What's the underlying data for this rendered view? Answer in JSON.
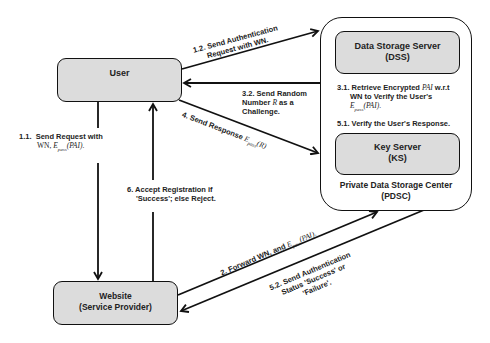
{
  "nodes": {
    "user": {
      "label": "User"
    },
    "website": {
      "line1": "Website",
      "line2": "(Service Provider)"
    },
    "pdsc": {
      "line1": "Private Data Storage Center",
      "line2": "(PDSC)"
    },
    "dss": {
      "line1": "Data Storage Server",
      "line2": "(DSS)"
    },
    "ks": {
      "line1": "Key Server",
      "line2": "(KS)"
    }
  },
  "steps": {
    "s1_1": {
      "num": "1.1.",
      "line1": "Send Request with",
      "line2_prefix": "WN, ",
      "line2_math": "E",
      "line2_sub": "pass",
      "line2_args": "(PAI)",
      "line2_suffix": "."
    },
    "s1_2": {
      "line1": "1.2. Send Authentication",
      "line2": "Request with WN."
    },
    "s2": {
      "text": "2. Forward WN, and ",
      "math": "E",
      "sub": "pass",
      "args": "(PAI)",
      "suffix": "."
    },
    "s3_1": {
      "line1_prefix": "3.1. Retrieve Encrypted ",
      "line1_math": "PAI",
      "line1_suffix": " w.r.t",
      "line2": "WN to Verify the User's",
      "line3_math": "E",
      "line3_sub": "pass",
      "line3_args": "(PAI)",
      "line3_suffix": "."
    },
    "s3_2": {
      "line1": "3.2. Send Random",
      "line2_prefix": "Number ",
      "line2_math": "R",
      "line2_suffix": " as a",
      "line3": "Challenge."
    },
    "s4": {
      "text": "4. Send Response ",
      "math": "E",
      "sub": "pass",
      "args": "(R)"
    },
    "s5_1": {
      "text": "5.1. Verify the User's Response."
    },
    "s5_2": {
      "line1": "5.2. Send Authentication",
      "line2": "Status 'Success' or",
      "line3": "'Failure'."
    },
    "s6": {
      "line1": "6. Accept Registration if",
      "line2": "'Success'; else Reject."
    }
  },
  "colors": {
    "box_fill": "#dcdcdc",
    "stroke": "#111111",
    "text": "#222222",
    "background": "#ffffff"
  }
}
